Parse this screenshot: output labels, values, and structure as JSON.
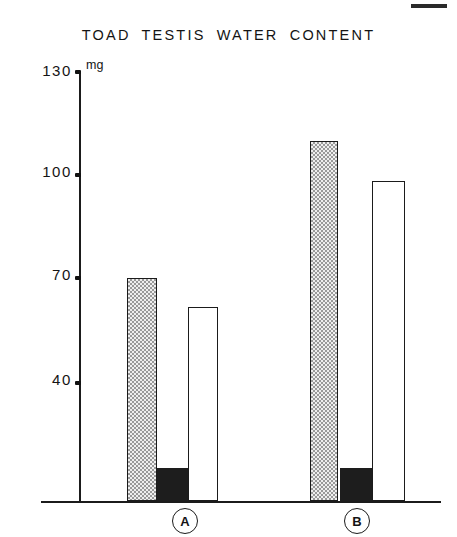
{
  "chart_data": {
    "type": "bar",
    "title": "TOAD  TESTIS  WATER  CONTENT",
    "xlabel": "",
    "ylabel": "mg",
    "unit": "mg",
    "ylim": [
      0,
      130
    ],
    "grid": false,
    "legend": "none",
    "yticks": [
      130,
      100,
      70,
      40
    ],
    "ytick_labels": [
      "130",
      "100",
      "70",
      "40"
    ],
    "categories": [
      "A",
      "B"
    ],
    "series": [
      {
        "name": "stippled-bar",
        "fill": "stippled",
        "values": [
          70.5,
          110.0
        ]
      },
      {
        "name": "solid-black-bar",
        "fill": "solid",
        "values": [
          15.5,
          15.5
        ]
      },
      {
        "name": "open-white-bar",
        "fill": "open",
        "values": [
          62.0,
          98.5
        ]
      }
    ]
  },
  "axis": {
    "unit_label": "mg",
    "ticks": [
      {
        "label": "130",
        "value": 130
      },
      {
        "label": "100",
        "value": 100
      },
      {
        "label": "70",
        "value": 70
      },
      {
        "label": "40",
        "value": 40
      }
    ]
  },
  "groups": [
    {
      "label": "A"
    },
    {
      "label": "B"
    }
  ],
  "colors": {
    "ink": "#1b1b1b",
    "stipple_fill": "#efefef",
    "stipple_dot": "#9a9a9a",
    "solid_fill": "#1d1d1d",
    "open_fill": "#ffffff",
    "background": "#ffffff"
  }
}
